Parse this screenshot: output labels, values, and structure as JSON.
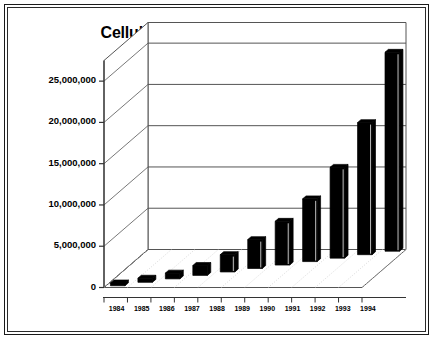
{
  "chart_data": {
    "type": "bar",
    "style": "3d-column",
    "title": "Cellular Subscribers in Millions",
    "xlabel": "",
    "ylabel": "",
    "categories": [
      "1984",
      "1985",
      "1986",
      "1987",
      "1988",
      "1989",
      "1990",
      "1991",
      "1992",
      "1993",
      "1994"
    ],
    "values": [
      340000,
      500000,
      700000,
      1200000,
      2100000,
      3500000,
      5300000,
      7600000,
      11000000,
      16000000,
      24100000
    ],
    "ylim": [
      0,
      27500000
    ],
    "ytick_values": [
      0,
      5000000,
      10000000,
      15000000,
      20000000,
      25000000
    ],
    "ytick_labels": [
      "0",
      "5,000,000",
      "10,000,000",
      "15,000,000",
      "20,000,000",
      "25,000,000"
    ],
    "grid": true,
    "gridlines": "horizontal-back-wall",
    "legend": null,
    "legend_position": "none",
    "bar_color": "#000000",
    "bar_side_color": "#000000",
    "bar_top_color": "#000000",
    "background_color": "#FFFFFF",
    "axis_color": "#555555",
    "frame_color": "#1A1A1A",
    "series": [
      {
        "name": "Cellular Subscribers",
        "values": [
          340000,
          500000,
          700000,
          1200000,
          2100000,
          3500000,
          5300000,
          7600000,
          11000000,
          16000000,
          24100000
        ]
      }
    ]
  },
  "figure": {
    "title": "Cellular Subscribers in Millions"
  }
}
